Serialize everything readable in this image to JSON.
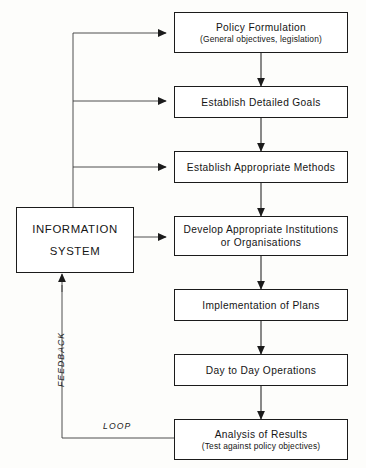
{
  "diagram": {
    "colors": {
      "line": "#1b1b1b",
      "box_fill": "#ffffff",
      "background": "#fdfdfb",
      "text": "#151515"
    },
    "nodes": [
      {
        "id": "policy-formulation",
        "title": "Policy Formulation",
        "subtitle": "(General objectives, legislation)"
      },
      {
        "id": "establish-detailed-goals",
        "title": "Establish Detailed Goals",
        "subtitle": ""
      },
      {
        "id": "establish-appropriate-methods",
        "title": "Establish Appropriate Methods",
        "subtitle": ""
      },
      {
        "id": "develop-appropriate-institutions",
        "title": "Develop Appropriate Institutions",
        "line2": "or Organisations"
      },
      {
        "id": "implementation-of-plans",
        "title": "Implementation of Plans",
        "subtitle": ""
      },
      {
        "id": "day-to-day-operations",
        "title": "Day to Day Operations",
        "subtitle": ""
      },
      {
        "id": "analysis-of-results",
        "title": "Analysis of Results",
        "subtitle": "(Test against policy objectives)"
      }
    ],
    "information_system": {
      "line1": "INFORMATION",
      "line2": "SYSTEM"
    },
    "edge_labels": {
      "feedback": "FEEDBACK",
      "loop": "LOOP"
    }
  }
}
